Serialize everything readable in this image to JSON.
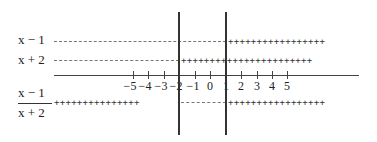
{
  "rows": {
    "factor1": {
      "label": "x − 1",
      "left_sign": "−",
      "right_sign": "+"
    },
    "factor2": {
      "label": "x + 2",
      "left_sign": "−",
      "right_sign": "+"
    },
    "quotient": {
      "numerator": "x − 1",
      "denominator": "x + 2",
      "left_sign": "+",
      "middle_sign": "−",
      "right_sign": "+"
    }
  },
  "critical_points": [
    -2,
    1
  ],
  "axis": {
    "ticks": [
      {
        "value": -5,
        "label": "−5"
      },
      {
        "value": -4,
        "label": "−4"
      },
      {
        "value": -3,
        "label": "−3"
      },
      {
        "value": -2,
        "label": "−2"
      },
      {
        "value": -1,
        "label": "−1"
      },
      {
        "value": 0,
        "label": "0"
      },
      {
        "value": 1,
        "label": "1"
      },
      {
        "value": 2,
        "label": "2"
      },
      {
        "value": 3,
        "label": "3"
      },
      {
        "value": 4,
        "label": "4"
      },
      {
        "value": 5,
        "label": "5"
      }
    ]
  },
  "signs": {
    "plus_run_right": "+++++++++++++++++",
    "plus_run_mid": "+++++++++++++++++++++++",
    "plus_run_left": "+++++++++++++++"
  }
}
